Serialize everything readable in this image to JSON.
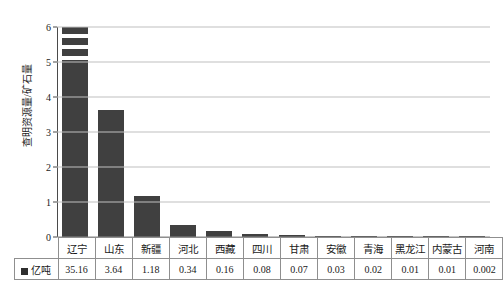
{
  "chart_data": {
    "type": "bar",
    "title": "",
    "xlabel": "",
    "ylabel": "查明资源量/矿石量",
    "ylim": [
      0,
      6
    ],
    "yticks": [
      0,
      1,
      2,
      3,
      4,
      5,
      6
    ],
    "grid": true,
    "legend_position": "table-row-header",
    "axis_break": {
      "present": true,
      "between": [
        5,
        6
      ],
      "applies_to_category": "辽宁",
      "note": "第一根柱被截断显示"
    },
    "categories": [
      "辽宁",
      "山东",
      "新疆",
      "河北",
      "西藏",
      "四川",
      "甘肃",
      "安徽",
      "青海",
      "黑龙江",
      "内蒙古",
      "河南"
    ],
    "series": [
      {
        "name": "亿吨",
        "color": "#404040",
        "values": [
          35.16,
          3.64,
          1.18,
          0.34,
          0.16,
          0.08,
          0.07,
          0.03,
          0.02,
          0.01,
          0.01,
          0.002
        ],
        "plotted_heights": [
          6.2,
          3.64,
          1.18,
          0.34,
          0.16,
          0.08,
          0.07,
          0.03,
          0.02,
          0.01,
          0.01,
          0.002
        ]
      }
    ],
    "value_labels": [
      "35.16",
      "3.64",
      "1.18",
      "0.34",
      "0.16",
      "0.08",
      "0.07",
      "0.03",
      "0.02",
      "0.01",
      "0.01",
      "0.002"
    ]
  },
  "table": {
    "legend_label": "亿吨",
    "legend_swatch_color": "#2e2e2e"
  },
  "colors": {
    "bar": "#404040",
    "gridline": "#bfbfbf",
    "axis": "#4a4a4a",
    "table_border": "#8f8f8f",
    "text": "#1a1a1a",
    "background": "#ffffff"
  }
}
